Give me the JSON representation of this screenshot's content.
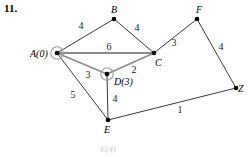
{
  "problem": {
    "number": "11."
  },
  "graph": {
    "type": "weighted-undirected-graph",
    "colors": {
      "edge": "#3a3a3a",
      "highlighted_edge": "#8c8c8c",
      "node_fill": "#000000",
      "marker_ring": "#9a9a9a",
      "text": "#000000",
      "background": "#ffffff"
    },
    "nodes": [
      {
        "id": "A",
        "label": "A(0)",
        "labelParen": true,
        "x": 57,
        "y": 53,
        "lx": 30,
        "ly": 57,
        "marked": true
      },
      {
        "id": "B",
        "label": "B",
        "x": 114,
        "y": 19,
        "lx": 111,
        "ly": 13,
        "marked": false
      },
      {
        "id": "C",
        "label": "C",
        "x": 154,
        "y": 53,
        "lx": 155,
        "ly": 66,
        "marked": false
      },
      {
        "id": "D",
        "label": "D(3)",
        "labelParen": true,
        "x": 107,
        "y": 74,
        "lx": 114,
        "ly": 85,
        "marked": true
      },
      {
        "id": "E",
        "label": "E",
        "x": 108,
        "y": 120,
        "lx": 104,
        "ly": 133,
        "marked": false
      },
      {
        "id": "F",
        "label": "F",
        "x": 197,
        "y": 19,
        "lx": 196,
        "ly": 13,
        "marked": false
      },
      {
        "id": "Z",
        "label": "Z",
        "x": 236,
        "y": 88,
        "lx": 238,
        "ly": 92,
        "marked": false
      }
    ],
    "edges": [
      {
        "from": "A",
        "to": "B",
        "weight": "4",
        "wx": 81,
        "wy": 29,
        "highlighted": false
      },
      {
        "from": "B",
        "to": "C",
        "weight": "4",
        "wx": 137,
        "wy": 31,
        "highlighted": false
      },
      {
        "from": "A",
        "to": "C",
        "weight": "6",
        "wx": 109,
        "wy": 50,
        "highlighted": true
      },
      {
        "from": "A",
        "to": "D",
        "weight": "3",
        "wx": 88,
        "wy": 78,
        "highlighted": true
      },
      {
        "from": "D",
        "to": "C",
        "weight": "2",
        "wx": 134,
        "wy": 73,
        "highlighted": true
      },
      {
        "from": "D",
        "to": "E",
        "weight": "4",
        "wx": 115,
        "wy": 102,
        "highlighted": false
      },
      {
        "from": "A",
        "to": "E",
        "weight": "5",
        "wx": 73,
        "wy": 98,
        "highlighted": false
      },
      {
        "from": "C",
        "to": "F",
        "weight": "3",
        "wx": 174,
        "wy": 46,
        "highlighted": false
      },
      {
        "from": "F",
        "to": "Z",
        "weight": "4",
        "wx": 221,
        "wy": 50,
        "highlighted": false
      },
      {
        "from": "E",
        "to": "Z",
        "weight": "1",
        "wx": 180,
        "wy": 113,
        "highlighted": false
      }
    ],
    "cutoff_label": {
      "text": "E(4)",
      "x": 108,
      "y": 152
    }
  }
}
